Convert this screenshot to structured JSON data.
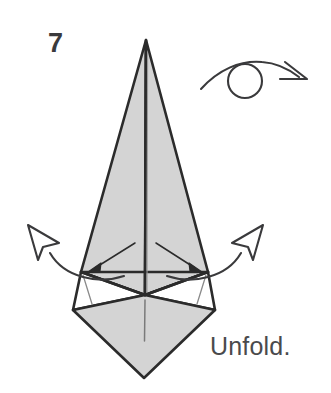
{
  "figure": {
    "type": "origami-instruction-diagram",
    "step_number": "7",
    "caption": "Unfold.",
    "background_color": "#ffffff",
    "paper_fill_color": "#d4d4d4",
    "paper_back_color": "#ffffff",
    "line_color": "#2b2b2b",
    "crease_color": "#6f6f6f",
    "text_color": "#3a3a3c"
  },
  "symbols": {
    "turn_over": {
      "name": "turn-over-symbol",
      "description": "loop arrow over circle meaning turn the model over",
      "circle_center_x": 245,
      "circle_center_y": 81,
      "circle_radius": 17,
      "arc_start_x": 202,
      "arc_start_y": 88,
      "arc_end_x": 300,
      "arc_end_y": 80
    },
    "unfold_arrow_left": {
      "name": "unfold-arrow-left",
      "description": "hollow outline arrow curving out to upper left"
    },
    "unfold_arrow_right": {
      "name": "unfold-arrow-right",
      "description": "hollow outline arrow curving out to upper right"
    },
    "inner_arrow_left": {
      "name": "inner-arrow-left",
      "description": "thin solid-head arrow pointing down-left to flap corner"
    },
    "inner_arrow_right": {
      "name": "inner-arrow-right",
      "description": "thin solid-head arrow pointing down-right to flap corner"
    }
  },
  "geometry": {
    "apex_x": 146,
    "apex_y": 40,
    "left_corner_x": 81,
    "left_corner_y": 272,
    "right_corner_x": 208,
    "right_corner_y": 272,
    "center_x": 145,
    "center_y": 295,
    "diamond_left_x": 73,
    "diamond_left_y": 310,
    "diamond_right_x": 215,
    "diamond_right_y": 310,
    "diamond_bottom_x": 144,
    "diamond_bottom_y": 378
  }
}
